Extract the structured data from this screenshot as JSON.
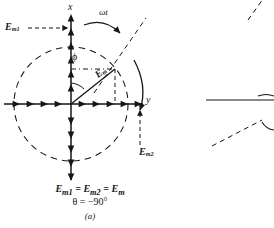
{
  "figure": {
    "label": "(a)",
    "axes": {
      "x_label": "x",
      "y_label": "y",
      "origin_x": 71,
      "origin_y": 104
    },
    "annotations": {
      "omega_t": "ωt",
      "phi": "ϕ",
      "e_m": "E",
      "e_m_sub": "m",
      "e_m1": "E",
      "e_m1_sub": "m1",
      "e_m2": "E",
      "e_m2_sub": "m2"
    },
    "caption": {
      "line1_a": "E",
      "line1_a_sub": "m1",
      "line1_eq1": " = ",
      "line1_b": "E",
      "line1_b_sub": "m2",
      "line1_eq2": " = ",
      "line1_c": "E",
      "line1_c_sub": "m",
      "line2": "θ = −90°",
      "line3": "(a)"
    },
    "colors": {
      "ink": "#161616",
      "background": "#ffffff"
    },
    "geometry": {
      "circle_radius": 57,
      "phasor_angle_deg": 38,
      "phasor_tip_x": 106,
      "phasor_tip_y": 69
    }
  },
  "partial_figure_right": {
    "visible": true,
    "description": "cut-off neighboring diagram at right edge"
  }
}
